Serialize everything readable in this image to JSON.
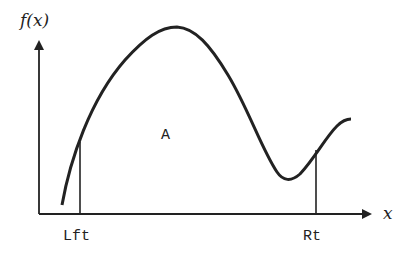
{
  "diagram": {
    "y_axis_label": "f(x)",
    "x_axis_label": "x",
    "region_label": "A",
    "left_bound_label": "Lft",
    "right_bound_label": "Rt",
    "colors": {
      "stroke": "#222222",
      "background": "#ffffff"
    }
  }
}
